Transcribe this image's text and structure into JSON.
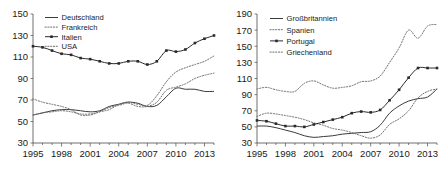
{
  "figure": {
    "panels": [
      {
        "name": "left",
        "legend": [
          "Deutschland",
          "Frankreich",
          "Italien",
          "USA"
        ],
        "yticks": [
          30,
          50,
          70,
          90,
          110,
          130,
          150
        ],
        "xticks": [
          1995,
          1998,
          2001,
          2004,
          2007,
          2010,
          2013
        ]
      },
      {
        "name": "right",
        "legend": [
          "Großbritannien",
          "Spanien",
          "Portugal",
          "Griechenland"
        ],
        "yticks": [
          30,
          50,
          70,
          90,
          110,
          130,
          150,
          170,
          190
        ],
        "xticks": [
          1995,
          1998,
          2001,
          2004,
          2007,
          2010,
          2013
        ]
      }
    ]
  },
  "chart_data": [
    {
      "type": "line",
      "title": "",
      "xlabel": "",
      "ylabel": "",
      "xlim": [
        1995,
        2014
      ],
      "ylim": [
        30,
        150
      ],
      "grid": false,
      "legend_position": "top-left",
      "x": [
        1995,
        1996,
        1997,
        1998,
        1999,
        2000,
        2001,
        2002,
        2003,
        2004,
        2005,
        2006,
        2007,
        2008,
        2009,
        2010,
        2011,
        2012,
        2013,
        2014
      ],
      "series": [
        {
          "name": "Deutschland",
          "style": "solid",
          "values": [
            56,
            58,
            60,
            61,
            61,
            60,
            59,
            60,
            64,
            66,
            68,
            67,
            64,
            65,
            73,
            81,
            80,
            80,
            78,
            78
          ]
        },
        {
          "name": "Frankreich",
          "style": "dotted",
          "values": [
            56,
            58,
            59,
            60,
            59,
            57,
            57,
            59,
            63,
            65,
            67,
            64,
            64,
            68,
            79,
            82,
            85,
            90,
            93,
            95
          ]
        },
        {
          "name": "Italien",
          "style": "solid-marker",
          "values": [
            120,
            119,
            116,
            113,
            112,
            109,
            108,
            106,
            104,
            104,
            106,
            106,
            103,
            106,
            116,
            115,
            117,
            123,
            127,
            130
          ]
        },
        {
          "name": "USA",
          "style": "dotted",
          "values": [
            71,
            68,
            66,
            64,
            61,
            56,
            56,
            59,
            61,
            66,
            68,
            66,
            65,
            74,
            87,
            96,
            100,
            103,
            106,
            111
          ]
        }
      ]
    },
    {
      "type": "line",
      "title": "",
      "xlabel": "",
      "ylabel": "",
      "xlim": [
        1995,
        2014
      ],
      "ylim": [
        30,
        190
      ],
      "grid": false,
      "legend_position": "top-left",
      "x": [
        1995,
        1996,
        1997,
        1998,
        1999,
        2000,
        2001,
        2002,
        2003,
        2004,
        2005,
        2006,
        2007,
        2008,
        2009,
        2010,
        2011,
        2012,
        2013,
        2014
      ],
      "series": [
        {
          "name": "Großbritannien",
          "style": "solid",
          "values": [
            51,
            51,
            49,
            46,
            43,
            39,
            37,
            38,
            39,
            41,
            42,
            43,
            44,
            52,
            67,
            76,
            82,
            85,
            87,
            97
          ]
        },
        {
          "name": "Spanien",
          "style": "dotted",
          "values": [
            63,
            67,
            66,
            64,
            62,
            59,
            55,
            52,
            48,
            46,
            43,
            39,
            36,
            40,
            53,
            60,
            70,
            86,
            94,
            97
          ]
        },
        {
          "name": "Portugal",
          "style": "solid-marker",
          "values": [
            58,
            57,
            54,
            51,
            51,
            50,
            53,
            56,
            59,
            62,
            67,
            69,
            68,
            71,
            83,
            96,
            111,
            123,
            123,
            123
          ]
        },
        {
          "name": "Griechenland",
          "style": "dotted",
          "values": [
            97,
            99,
            96,
            94,
            94,
            104,
            107,
            102,
            98,
            99,
            101,
            106,
            107,
            113,
            130,
            148,
            170,
            160,
            175,
            177
          ]
        }
      ]
    }
  ]
}
